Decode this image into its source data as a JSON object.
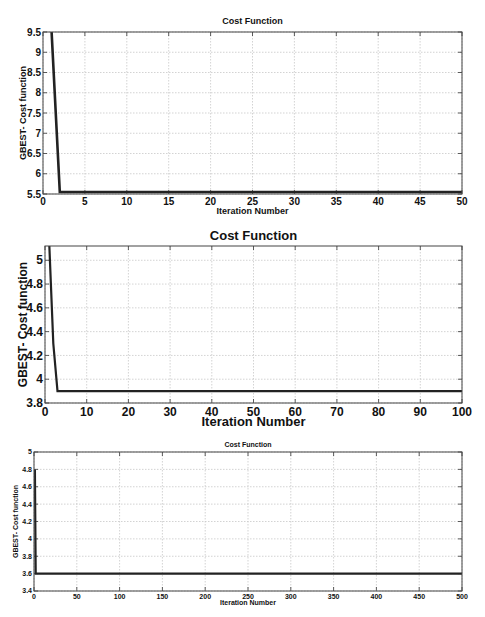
{
  "chart_data": [
    {
      "type": "line",
      "title": "Cost Function",
      "xlabel": "Iteration Number",
      "ylabel": "GBEST- Cost function",
      "xlim": [
        0,
        50
      ],
      "ylim": [
        5.5,
        9.5
      ],
      "xticks": [
        0,
        5,
        10,
        15,
        20,
        25,
        30,
        35,
        40,
        45,
        50
      ],
      "yticks": [
        5.5,
        6,
        6.5,
        7,
        7.5,
        8,
        8.5,
        9,
        9.5
      ],
      "ytick_labels": [
        "5.5",
        "6",
        "6.5",
        "7",
        "7.5",
        "8",
        "8.5",
        "9",
        "9.5"
      ],
      "grid": true,
      "series": [
        {
          "name": "GBEST",
          "x": [
            1,
            2,
            50
          ],
          "y": [
            9.6,
            5.55,
            5.55
          ]
        }
      ],
      "box": {
        "top": 32,
        "bottom": 194,
        "left": 43,
        "right": 462,
        "title_y": 24,
        "xlabel_y": 214,
        "ylabel_x": 26,
        "font": 10
      }
    },
    {
      "type": "line",
      "title": "Cost Function",
      "xlabel": "Iteration Number",
      "ylabel": "GBEST- Cost function",
      "xlim": [
        0,
        100
      ],
      "ylim": [
        3.8,
        5.12
      ],
      "xticks": [
        0,
        10,
        20,
        30,
        40,
        50,
        60,
        70,
        80,
        90,
        100
      ],
      "yticks": [
        3.8,
        4,
        4.2,
        4.4,
        4.6,
        4.8,
        5
      ],
      "ytick_labels": [
        "3.8",
        "4",
        "4.2",
        "4.4",
        "4.6",
        "4.8",
        "5"
      ],
      "grid": true,
      "series": [
        {
          "name": "GBEST",
          "x": [
            1,
            2,
            3,
            100
          ],
          "y": [
            5.15,
            4.3,
            3.9,
            3.9
          ]
        }
      ],
      "box": {
        "top": 246,
        "bottom": 403,
        "left": 45,
        "right": 462,
        "title_y": 240,
        "xlabel_y": 426,
        "ylabel_x": 27,
        "font": 12
      }
    },
    {
      "type": "line",
      "title": "Cost Function",
      "xlabel": "Iteration Number",
      "ylabel": "GBEST- Cost function",
      "xlim": [
        0,
        500
      ],
      "ylim": [
        3.4,
        5
      ],
      "xticks": [
        0,
        50,
        100,
        150,
        200,
        250,
        300,
        350,
        400,
        450,
        500
      ],
      "yticks": [
        3.4,
        3.6,
        3.8,
        4,
        4.2,
        4.4,
        4.6,
        4.8,
        5
      ],
      "ytick_labels": [
        "3.4",
        "3.6",
        "3.8",
        "4",
        "4.2",
        "4.4",
        "4.6",
        "4.8",
        "5"
      ],
      "grid": true,
      "series": [
        {
          "name": "GBEST",
          "x": [
            1,
            2,
            500
          ],
          "y": [
            4.8,
            3.6,
            3.6
          ]
        }
      ],
      "box": {
        "top": 452,
        "bottom": 591,
        "left": 34,
        "right": 462,
        "title_y": 447,
        "xlabel_y": 605,
        "ylabel_x": 18,
        "font": 7
      }
    }
  ]
}
